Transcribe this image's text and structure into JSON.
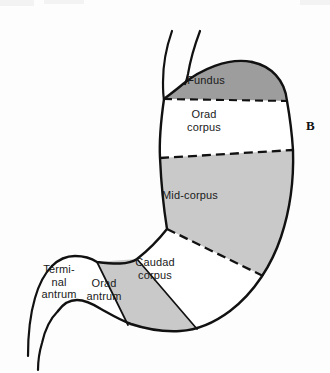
{
  "figure": {
    "panel_label": "B",
    "background_color": "#fdfdfd",
    "outline_color": "#111111",
    "text_color": "#1a1a1a"
  },
  "regions": [
    {
      "id": "fundus",
      "label": "Fundus",
      "fill": "#9d9d9d",
      "label_x": 206,
      "label_y": 80
    },
    {
      "id": "orad-corpus",
      "label": "Orad\ncorpus",
      "fill": "#ffffff",
      "label_x": 204,
      "label_y": 114
    },
    {
      "id": "mid-corpus",
      "label": "Mid-corpus",
      "fill": "#c9c9c9",
      "label_x": 190,
      "label_y": 195
    },
    {
      "id": "caudad-corpus",
      "label": "Caudad\ncorpus",
      "fill": "#ffffff",
      "label_x": 155,
      "label_y": 262
    },
    {
      "id": "orad-antrum",
      "label": "Orad\nantrum",
      "fill": "#c9c9c9",
      "label_x": 104,
      "label_y": 283
    },
    {
      "id": "terminal-antrum",
      "label": "Termi-\nnal\nantrum",
      "fill": "#ffffff",
      "label_x": 59,
      "label_y": 263
    }
  ]
}
